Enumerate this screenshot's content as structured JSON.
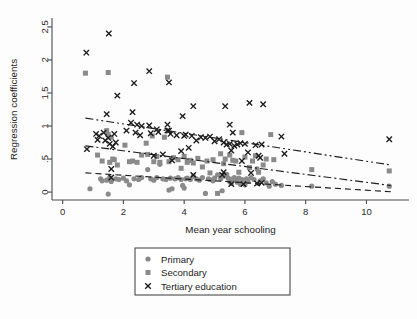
{
  "chart_data": {
    "type": "scatter",
    "title": "",
    "xlabel": "Mean year schooling",
    "ylabel": "Regression coefficients",
    "xlim": [
      -0.35,
      11.4
    ],
    "ylim": [
      -0.12,
      2.62
    ],
    "xticks": [
      0,
      2,
      4,
      6,
      8,
      10
    ],
    "xtick_labels": [
      "0",
      "2",
      "4",
      "6",
      "8",
      "10"
    ],
    "yticks": [
      0,
      0.5,
      1,
      1.5,
      2,
      2.5
    ],
    "ytick_labels": [
      "0",
      ".5",
      "1",
      "1.5",
      "2",
      "2.5"
    ],
    "grid": false,
    "legend_position": "below-center",
    "series": [
      {
        "name": "Primary",
        "marker": "circle",
        "color": "#8a8a8a",
        "trend_style": "dashed",
        "trend_endpoints": [
          [
            0.75,
            0.29
          ],
          [
            10.8,
            0.005
          ]
        ],
        "points": [
          [
            0.9,
            0.05
          ],
          [
            1.25,
            0.2
          ],
          [
            1.3,
            0.17
          ],
          [
            1.45,
            0.18
          ],
          [
            1.5,
            -0.03
          ],
          [
            1.55,
            0.22
          ],
          [
            1.6,
            0.16
          ],
          [
            1.75,
            0.2
          ],
          [
            1.85,
            0.19
          ],
          [
            2.0,
            0.21
          ],
          [
            2.1,
            0.17
          ],
          [
            2.2,
            0.11
          ],
          [
            2.35,
            0.2
          ],
          [
            2.5,
            0.19
          ],
          [
            2.6,
            0.22
          ],
          [
            2.8,
            0.34
          ],
          [
            2.9,
            0.2
          ],
          [
            3.0,
            0.18
          ],
          [
            3.1,
            0.22
          ],
          [
            3.2,
            0.42
          ],
          [
            3.3,
            0.2
          ],
          [
            3.4,
            0.19
          ],
          [
            3.5,
            0.03
          ],
          [
            3.55,
            0.21
          ],
          [
            3.6,
            0.05
          ],
          [
            3.7,
            0.2
          ],
          [
            3.8,
            0.22
          ],
          [
            3.9,
            0.19
          ],
          [
            3.95,
            0.1
          ],
          [
            4.0,
            0.06
          ],
          [
            4.05,
            0.2
          ],
          [
            4.1,
            0.21
          ],
          [
            4.2,
            0.19
          ],
          [
            4.3,
            0.24
          ],
          [
            4.4,
            0.2
          ],
          [
            4.5,
            0.18
          ],
          [
            4.6,
            0.22
          ],
          [
            4.7,
            -0.02
          ],
          [
            4.8,
            0.2
          ],
          [
            4.85,
            0.19
          ],
          [
            4.95,
            0.17
          ],
          [
            5.0,
            0.21
          ],
          [
            5.1,
            0.26
          ],
          [
            5.2,
            0.2
          ],
          [
            5.25,
            0.02
          ],
          [
            5.3,
            0.24
          ],
          [
            5.4,
            0.27
          ],
          [
            5.45,
            0.21
          ],
          [
            5.5,
            0.16
          ],
          [
            5.55,
            0.13
          ],
          [
            5.6,
            0.2
          ],
          [
            5.65,
            0.22
          ],
          [
            5.7,
            0.18
          ],
          [
            5.75,
            0.15
          ],
          [
            5.8,
            0.21
          ],
          [
            5.85,
            0.12
          ],
          [
            5.9,
            0.19
          ],
          [
            5.95,
            0.14
          ],
          [
            6.0,
            0.11
          ],
          [
            6.05,
            0.2
          ],
          [
            6.1,
            0.16
          ],
          [
            6.2,
            0.22
          ],
          [
            6.3,
            0.19
          ],
          [
            6.4,
            0.35
          ],
          [
            6.45,
            0.13
          ],
          [
            6.5,
            0.17
          ],
          [
            6.6,
            0.2
          ],
          [
            6.7,
            0.14
          ],
          [
            6.8,
            0.09
          ],
          [
            6.9,
            0.16
          ],
          [
            7.0,
            0.12
          ],
          [
            7.2,
            0.1
          ],
          [
            8.2,
            0.09
          ],
          [
            10.75,
            0.09
          ]
        ]
      },
      {
        "name": "Secondary",
        "marker": "square",
        "color": "#8a8a8a",
        "trend_style": "dash-dot",
        "trend_endpoints": [
          [
            0.75,
            0.7
          ],
          [
            10.8,
            0.1
          ]
        ],
        "points": [
          [
            0.75,
            1.8
          ],
          [
            1.5,
            1.81
          ],
          [
            3.45,
            1.74
          ],
          [
            1.15,
            0.56
          ],
          [
            1.3,
            0.47
          ],
          [
            1.45,
            0.93
          ],
          [
            1.5,
            0.87
          ],
          [
            1.55,
            0.45
          ],
          [
            1.6,
            0.83
          ],
          [
            1.65,
            0.5
          ],
          [
            1.7,
            0.49
          ],
          [
            1.8,
            0.41
          ],
          [
            2.05,
            0.71
          ],
          [
            2.2,
            0.46
          ],
          [
            2.3,
            0.47
          ],
          [
            2.45,
            0.45
          ],
          [
            2.6,
            0.56
          ],
          [
            2.75,
            0.74
          ],
          [
            2.8,
            0.57
          ],
          [
            2.95,
            0.85
          ],
          [
            3.0,
            0.46
          ],
          [
            3.1,
            0.54
          ],
          [
            3.2,
            0.45
          ],
          [
            3.35,
            0.83
          ],
          [
            3.5,
            0.46
          ],
          [
            3.65,
            0.52
          ],
          [
            3.8,
            0.49
          ],
          [
            3.9,
            0.36
          ],
          [
            4.0,
            0.54
          ],
          [
            4.1,
            0.45
          ],
          [
            4.2,
            0.48
          ],
          [
            4.3,
            0.44
          ],
          [
            4.45,
            0.51
          ],
          [
            4.6,
            0.38
          ],
          [
            4.75,
            0.47
          ],
          [
            4.85,
            0.29
          ],
          [
            4.95,
            0.49
          ],
          [
            5.1,
            -0.02
          ],
          [
            5.2,
            0.58
          ],
          [
            5.3,
            0.43
          ],
          [
            5.35,
            0.5
          ],
          [
            5.5,
            0.56
          ],
          [
            5.6,
            0.48
          ],
          [
            5.7,
            0.47
          ],
          [
            5.8,
            0.3
          ],
          [
            5.9,
            0.9
          ],
          [
            6.0,
            0.53
          ],
          [
            6.15,
            0.37
          ],
          [
            6.25,
            0.47
          ],
          [
            6.35,
            0.55
          ],
          [
            6.45,
            0.3
          ],
          [
            6.6,
            0.41
          ],
          [
            6.7,
            0.5
          ],
          [
            6.85,
            0.87
          ],
          [
            6.95,
            0.49
          ],
          [
            8.2,
            0.34
          ],
          [
            10.75,
            0.32
          ]
        ]
      },
      {
        "name": "Tertiary education",
        "marker": "cross",
        "color": "#1c1c1c",
        "trend_style": "dash-dot-dot",
        "trend_endpoints": [
          [
            0.75,
            1.12
          ],
          [
            10.8,
            0.41
          ]
        ],
        "points": [
          [
            0.78,
            2.11
          ],
          [
            1.52,
            2.4
          ],
          [
            1.8,
            1.46
          ],
          [
            2.3,
            1.21
          ],
          [
            2.35,
            1.65
          ],
          [
            2.85,
            1.83
          ],
          [
            3.5,
            1.66
          ],
          [
            4.3,
            1.3
          ],
          [
            3.95,
            1.15
          ],
          [
            5.35,
            1.3
          ],
          [
            6.15,
            1.35
          ],
          [
            6.6,
            1.33
          ],
          [
            1.45,
            1.18
          ],
          [
            2.25,
            1.05
          ],
          [
            2.45,
            1.02
          ],
          [
            2.6,
            1.0
          ],
          [
            2.85,
            1.01
          ],
          [
            3.1,
            0.95
          ],
          [
            3.45,
            1.02
          ],
          [
            3.5,
            0.93
          ],
          [
            3.55,
            0.88
          ],
          [
            5.5,
            1.02
          ],
          [
            5.6,
            0.9
          ],
          [
            0.8,
            0.65
          ],
          [
            1.1,
            0.88
          ],
          [
            1.15,
            0.79
          ],
          [
            1.2,
            0.85
          ],
          [
            1.35,
            0.9
          ],
          [
            1.4,
            0.78
          ],
          [
            1.5,
            0.82
          ],
          [
            1.55,
            0.73
          ],
          [
            1.6,
            0.35
          ],
          [
            1.65,
            0.69
          ],
          [
            1.7,
            0.88
          ],
          [
            1.75,
            0.75
          ],
          [
            2.1,
            0.93
          ],
          [
            2.4,
            0.9
          ],
          [
            2.55,
            0.86
          ],
          [
            2.9,
            0.89
          ],
          [
            3.0,
            0.55
          ],
          [
            3.15,
            0.91
          ],
          [
            3.3,
            0.57
          ],
          [
            3.45,
            0.93
          ],
          [
            3.6,
            0.48
          ],
          [
            3.75,
            0.86
          ],
          [
            3.9,
            0.62
          ],
          [
            4.0,
            0.85
          ],
          [
            4.05,
            0.87
          ],
          [
            4.15,
            0.67
          ],
          [
            4.25,
            0.85
          ],
          [
            4.4,
            0.78
          ],
          [
            4.55,
            0.83
          ],
          [
            4.7,
            0.82
          ],
          [
            4.85,
            0.84
          ],
          [
            5.0,
            0.77
          ],
          [
            5.15,
            0.8
          ],
          [
            5.3,
            0.75
          ],
          [
            5.4,
            0.72
          ],
          [
            5.5,
            0.73
          ],
          [
            5.55,
            0.63
          ],
          [
            5.65,
            0.7
          ],
          [
            5.75,
            0.72
          ],
          [
            5.85,
            0.74
          ],
          [
            5.9,
            0.47
          ],
          [
            6.0,
            0.73
          ],
          [
            6.1,
            0.6
          ],
          [
            6.2,
            0.29
          ],
          [
            6.35,
            0.71
          ],
          [
            6.45,
            0.55
          ],
          [
            6.5,
            0.52
          ],
          [
            6.55,
            0.72
          ],
          [
            7.2,
            0.84
          ],
          [
            7.3,
            0.58
          ],
          [
            10.75,
            0.8
          ],
          [
            1.6,
            0.22
          ],
          [
            5.25,
            0.26
          ],
          [
            5.3,
            0.3
          ],
          [
            5.55,
            0.12
          ],
          [
            5.95,
            0.12
          ],
          [
            6.4,
            0.13
          ],
          [
            4.3,
            0.26
          ],
          [
            6.55,
            0.14
          ]
        ]
      }
    ]
  },
  "legend": {
    "items": [
      {
        "label": "Primary",
        "marker": "circle"
      },
      {
        "label": "Secondary",
        "marker": "square"
      },
      {
        "label": "Tertiary education",
        "marker": "cross"
      }
    ]
  }
}
